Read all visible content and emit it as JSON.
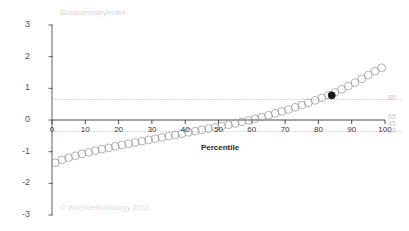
{
  "chart_data": {
    "type": "scatter",
    "title": "Bussummaryindex",
    "xlabel": "Percentile",
    "ylabel": "",
    "xlim": [
      0,
      100
    ],
    "ylim": [
      -3,
      3
    ],
    "grid": false,
    "legend": "none",
    "x_ticks": [
      0,
      10,
      20,
      30,
      40,
      50,
      60,
      70,
      80,
      90,
      100
    ],
    "x_tick_labels": [
      "0",
      "10",
      "20",
      "30",
      "40",
      "50",
      "60",
      "70",
      "80",
      "90",
      "100"
    ],
    "y_ticks": [
      3,
      2,
      1,
      0,
      -1,
      -2,
      -3
    ],
    "y_tick_labels": [
      "3",
      "2",
      "1",
      "0",
      "-1",
      "-2",
      "-3"
    ],
    "right_axis_labels": [
      {
        "text": "80",
        "value": 0.65
      },
      {
        "text": "65",
        "value": 0.07
      },
      {
        "text": "45",
        "value": -0.16
      },
      {
        "text": "30",
        "value": -0.37
      }
    ],
    "reference_lines": [
      {
        "value": 0.65,
        "style": "dotted",
        "color": "#b9b9b9"
      },
      {
        "value": -0.36,
        "style": "dotted",
        "color": "#b9b9b9"
      }
    ],
    "series": [
      {
        "name": "Bussummaryindex",
        "marker": "open-circle",
        "color": "#9a9a9a",
        "x": [
          1,
          3,
          5,
          7,
          9,
          11,
          13,
          15,
          17,
          19,
          21,
          23,
          25,
          27,
          29,
          31,
          33,
          35,
          37,
          39,
          41,
          43,
          45,
          47,
          49,
          51,
          53,
          55,
          57,
          59,
          61,
          63,
          65,
          67,
          69,
          71,
          73,
          75,
          77,
          79,
          81,
          83,
          85,
          87,
          89,
          91,
          93,
          95,
          97,
          99
        ],
        "y": [
          -1.35,
          -1.26,
          -1.19,
          -1.13,
          -1.07,
          -1.02,
          -0.97,
          -0.92,
          -0.88,
          -0.83,
          -0.79,
          -0.75,
          -0.71,
          -0.67,
          -0.63,
          -0.59,
          -0.55,
          -0.51,
          -0.47,
          -0.43,
          -0.39,
          -0.35,
          -0.31,
          -0.27,
          -0.23,
          -0.19,
          -0.15,
          -0.11,
          -0.06,
          -0.01,
          0.04,
          0.09,
          0.15,
          0.21,
          0.27,
          0.33,
          0.4,
          0.47,
          0.54,
          0.62,
          0.7,
          0.78,
          0.87,
          0.97,
          1.07,
          1.18,
          1.3,
          1.42,
          1.54,
          1.65
        ]
      },
      {
        "name": "Highlighted point",
        "marker": "filled-circle",
        "color": "#1a1a1a",
        "x": [
          84
        ],
        "y": [
          0.78
        ]
      }
    ]
  },
  "chart": {
    "title": "Bussummaryindex",
    "x_axis_title": "Percentile",
    "copyright": "© BUSMethodology 2011"
  }
}
